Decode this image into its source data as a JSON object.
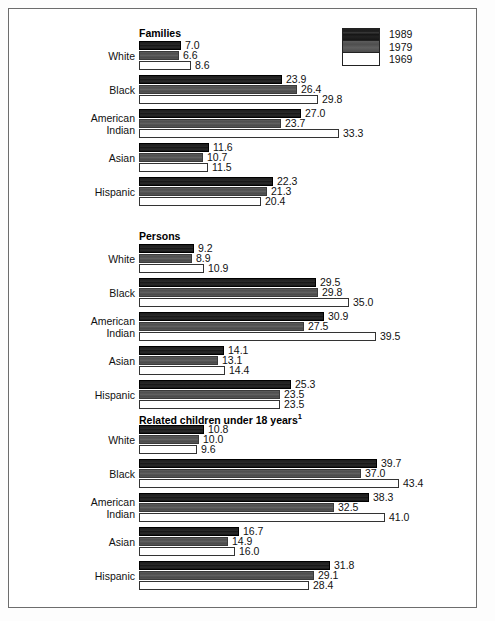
{
  "chart_data": {
    "type": "bar",
    "orientation": "horizontal",
    "title": "",
    "xlabel": "",
    "ylabel": "",
    "grid": false,
    "legend_position": "top-right",
    "xlim": [
      0,
      44
    ],
    "axis_scale_px_per_unit": 6.0,
    "legend": {
      "entries": [
        {
          "label": "1989",
          "color": "#1c1c1c",
          "swatch": "dark"
        },
        {
          "label": "1979",
          "color": "#555555",
          "swatch": "gray"
        },
        {
          "label": "1969",
          "color": "#ffffff",
          "swatch": "white"
        }
      ]
    },
    "series": [
      {
        "name": "1989"
      },
      {
        "name": "1979"
      },
      {
        "name": "1969"
      }
    ],
    "categories": [
      "White",
      "Black",
      "American Indian",
      "Asian",
      "Hispanic"
    ],
    "panels": [
      {
        "title": "Families",
        "title_superscript": "",
        "groups": [
          {
            "label_lines": [
              "White"
            ],
            "values": [
              7.0,
              6.6,
              8.6
            ],
            "labels": [
              "7.0",
              "6.6",
              "8.6"
            ]
          },
          {
            "label_lines": [
              "Black"
            ],
            "values": [
              23.9,
              26.4,
              29.8
            ],
            "labels": [
              "23.9",
              "26.4",
              "29.8"
            ]
          },
          {
            "label_lines": [
              "American",
              "Indian"
            ],
            "values": [
              27.0,
              23.7,
              33.3
            ],
            "labels": [
              "27.0",
              "23.7",
              "33.3"
            ]
          },
          {
            "label_lines": [
              "Asian"
            ],
            "values": [
              11.6,
              10.7,
              11.5
            ],
            "labels": [
              "11.6",
              "10.7",
              "11.5"
            ]
          },
          {
            "label_lines": [
              "Hispanic"
            ],
            "values": [
              22.3,
              21.3,
              20.4
            ],
            "labels": [
              "22.3",
              "21.3",
              "20.4"
            ]
          }
        ]
      },
      {
        "title": "Persons",
        "title_superscript": "",
        "groups": [
          {
            "label_lines": [
              "White"
            ],
            "values": [
              9.2,
              8.9,
              10.9
            ],
            "labels": [
              "9.2",
              "8.9",
              "10.9"
            ]
          },
          {
            "label_lines": [
              "Black"
            ],
            "values": [
              29.5,
              29.8,
              35.0
            ],
            "labels": [
              "29.5",
              "29.8",
              "35.0"
            ]
          },
          {
            "label_lines": [
              "American",
              "Indian"
            ],
            "values": [
              30.9,
              27.5,
              39.5
            ],
            "labels": [
              "30.9",
              "27.5",
              "39.5"
            ]
          },
          {
            "label_lines": [
              "Asian"
            ],
            "values": [
              14.1,
              13.1,
              14.4
            ],
            "labels": [
              "14.1",
              "13.1",
              "14.4"
            ]
          },
          {
            "label_lines": [
              "Hispanic"
            ],
            "values": [
              25.3,
              23.5,
              23.5
            ],
            "labels": [
              "25.3",
              "23.5",
              "23.5"
            ]
          }
        ]
      },
      {
        "title": "Related children under 18 years",
        "title_superscript": "1",
        "groups": [
          {
            "label_lines": [
              "White"
            ],
            "values": [
              10.8,
              10.0,
              9.6
            ],
            "labels": [
              "10.8",
              "10.0",
              "9.6"
            ]
          },
          {
            "label_lines": [
              "Black"
            ],
            "values": [
              39.7,
              37.0,
              43.4
            ],
            "labels": [
              "39.7",
              "37.0",
              "43.4"
            ]
          },
          {
            "label_lines": [
              "American",
              "Indian"
            ],
            "values": [
              38.3,
              32.5,
              41.0
            ],
            "labels": [
              "38.3",
              "32.5",
              "41.0"
            ]
          },
          {
            "label_lines": [
              "Asian"
            ],
            "values": [
              16.7,
              14.9,
              16.0
            ],
            "labels": [
              "16.7",
              "14.9",
              "16.0"
            ]
          },
          {
            "label_lines": [
              "Hispanic"
            ],
            "values": [
              31.8,
              29.1,
              28.4
            ],
            "labels": [
              "31.8",
              "29.1",
              "28.4"
            ]
          }
        ]
      }
    ]
  },
  "layout": {
    "panel_title_tops": [
      26,
      229,
      411
    ],
    "panel_first_group_tops": [
      40,
      243,
      424
    ],
    "group_pitch": 34,
    "title_left": 138
  }
}
